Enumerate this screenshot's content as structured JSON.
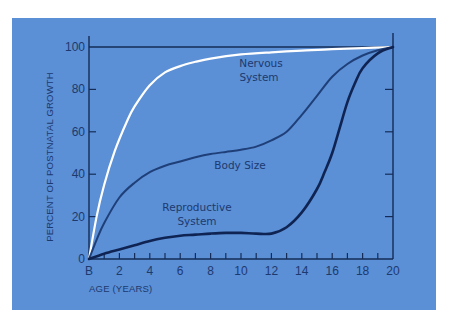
{
  "chart_data": {
    "type": "line",
    "title": "",
    "xlabel": "AGE (YEARS)",
    "ylabel": "PERCENT OF POSTNATAL GROWTH",
    "x_tick_labels": [
      "B",
      "2",
      "4",
      "6",
      "8",
      "10",
      "12",
      "14",
      "16",
      "18",
      "20"
    ],
    "x_ticks": [
      0,
      2,
      4,
      6,
      8,
      10,
      12,
      14,
      16,
      18,
      20
    ],
    "y_ticks": [
      0,
      20,
      40,
      60,
      80,
      100
    ],
    "y_tick_labels": [
      "0",
      "20",
      "40",
      "60",
      "80",
      "100"
    ],
    "xlim": [
      0,
      20
    ],
    "ylim": [
      0,
      100
    ],
    "grid": false,
    "legend": "inline labels",
    "series": [
      {
        "name": "Nervous System",
        "label_lines": [
          "Nervous",
          "System"
        ],
        "color": "#ffffff",
        "stroke_width": 2.2,
        "x": [
          0,
          0.5,
          1,
          1.7,
          2.5,
          3,
          4,
          5,
          6,
          7,
          8,
          10,
          12,
          14,
          16,
          18,
          20
        ],
        "y": [
          0,
          20,
          35,
          51,
          65,
          72,
          82,
          88,
          91,
          93,
          94.5,
          96.5,
          97.5,
          98.3,
          99,
          99.5,
          100
        ]
      },
      {
        "name": "Body Size",
        "label_lines": [
          "Body Size"
        ],
        "color": "#1f3f78",
        "stroke_width": 2,
        "x": [
          0,
          0.5,
          1,
          2,
          3,
          4,
          5,
          6,
          7,
          8,
          9,
          10,
          11,
          12,
          13,
          14,
          15,
          16,
          17,
          18,
          19,
          20
        ],
        "y": [
          0,
          9,
          17,
          29,
          36,
          41,
          44,
          46,
          48,
          49.5,
          50.5,
          51.5,
          53,
          56,
          60,
          68,
          77,
          86,
          92,
          96,
          98.5,
          100
        ]
      },
      {
        "name": "Reproductive System",
        "label_lines": [
          "Reproductive",
          "System"
        ],
        "color": "#0f2452",
        "stroke_width": 2.6,
        "x": [
          0,
          1,
          2,
          3,
          4,
          5,
          6,
          7,
          8,
          9,
          10,
          11,
          12,
          13,
          14,
          15,
          15.5,
          16,
          16.5,
          17,
          17.5,
          18,
          19,
          20
        ],
        "y": [
          0,
          2.5,
          4.5,
          6.5,
          8.5,
          10,
          11,
          11.5,
          12,
          12.3,
          12.3,
          12,
          12,
          15,
          22,
          33,
          41,
          50,
          62,
          74,
          83,
          90,
          97,
          100
        ]
      }
    ]
  },
  "labels": {
    "ylabel": "PERCENT OF POSTNATAL GROWTH",
    "xlabel": "AGE (YEARS)",
    "nervous_1": "Nervous",
    "nervous_2": "System",
    "body": "Body Size",
    "repro_1": "Reproductive",
    "repro_2": "System"
  },
  "colors": {
    "panel": "#5b8fd6",
    "axis": "#142c57",
    "text": "#1d3a6e",
    "page_background": "#ffffff"
  }
}
